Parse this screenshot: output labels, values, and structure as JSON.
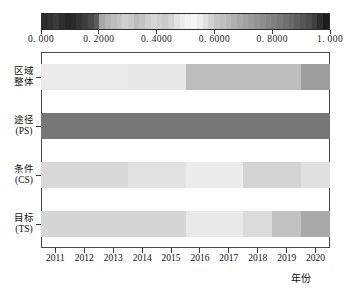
{
  "colorbar": {
    "min_label": "0. 000",
    "max_label": "1. 000",
    "tick_labels": [
      "0. 000",
      "0. 2000",
      "0. 4000",
      "0. 6000",
      "0. 8000",
      "1. 000"
    ],
    "tick_values": [
      0.0,
      0.2,
      0.4,
      0.6,
      0.8,
      1.0
    ],
    "gradient_stops": [
      "#2b2b2b",
      "#333333",
      "#3c3c3c",
      "#2e2e2e",
      "#262626",
      "#2a2a2a",
      "#343434",
      "#3d3d3d",
      "#4a4a4a",
      "#5c5c5c",
      "#a8a8a8",
      "#b4b4b4",
      "#bdbdbd",
      "#c4c4c4",
      "#cfcfcf",
      "#c8c8c8",
      "#bcbcbc",
      "#c2c2c2",
      "#cdcdcd",
      "#d6d6d6",
      "#d0d0d0",
      "#cacaca",
      "#d4d4d4",
      "#e2e2e2",
      "#ececec",
      "#f2f2f2",
      "#f6f6f6",
      "#ededed",
      "#e0e0e0",
      "#d2d2d2",
      "#c6c6c6",
      "#bfbfbf",
      "#b8b8b8",
      "#b0b0b0",
      "#a9a9a9",
      "#a2a2a2",
      "#9b9b9b",
      "#949494",
      "#8d8d8d",
      "#868686",
      "#7f7f7f",
      "#787878",
      "#707070",
      "#686868",
      "#5f5f5f",
      "#565656",
      "#4c4c4c",
      "#3f3f3f",
      "#2d2d2d",
      "#1c1c1c"
    ]
  },
  "chart_data": {
    "type": "heatmap",
    "title": "",
    "xlabel": "年份",
    "ylabel": "",
    "categories": [
      "2011",
      "2012",
      "2013",
      "2014",
      "2015",
      "2016",
      "2017",
      "2018",
      "2019",
      "2020"
    ],
    "rows": [
      {
        "label_line1": "区域",
        "label_line2": "整体",
        "name": "区域整体",
        "values": [
          0.47,
          0.47,
          0.47,
          0.48,
          0.48,
          0.61,
          0.61,
          0.61,
          0.61,
          0.68
        ],
        "colors": [
          "#ebebeb",
          "#ebebeb",
          "#ebebeb",
          "#e7e7e7",
          "#e7e7e7",
          "#bdbdbd",
          "#bdbdbd",
          "#bdbdbd",
          "#bdbdbd",
          "#9e9e9e"
        ]
      },
      {
        "label_line1": "途径",
        "label_line2": "(PS)",
        "name": "途径(PS)",
        "values": [
          0.82,
          0.82,
          0.82,
          0.82,
          0.82,
          0.82,
          0.82,
          0.82,
          0.82,
          0.82
        ],
        "colors": [
          "#777777",
          "#777777",
          "#777777",
          "#777777",
          "#777777",
          "#777777",
          "#777777",
          "#777777",
          "#777777",
          "#777777"
        ]
      },
      {
        "label_line1": "条件",
        "label_line2": "(CS)",
        "name": "条件(CS)",
        "values": [
          0.52,
          0.52,
          0.52,
          0.49,
          0.49,
          0.47,
          0.47,
          0.54,
          0.54,
          0.5
        ],
        "colors": [
          "#d9d9d9",
          "#d9d9d9",
          "#d9d9d9",
          "#e2e2e2",
          "#e2e2e2",
          "#ececec",
          "#ececec",
          "#d4d4d4",
          "#d4d4d4",
          "#e0e0e0"
        ]
      },
      {
        "label_line1": "目标",
        "label_line2": "(TS)",
        "name": "目标(TS)",
        "values": [
          0.54,
          0.54,
          0.54,
          0.54,
          0.54,
          0.49,
          0.49,
          0.52,
          0.59,
          0.65
        ],
        "colors": [
          "#d6d6d6",
          "#d6d6d6",
          "#d6d6d6",
          "#d6d6d6",
          "#d6d6d6",
          "#e9e9e9",
          "#e9e9e9",
          "#dcdcdc",
          "#c2c2c2",
          "#a9a9a9"
        ]
      }
    ],
    "colorbar_range": [
      0.0,
      1.0
    ],
    "grid": false,
    "legend": "colorbar-top"
  }
}
